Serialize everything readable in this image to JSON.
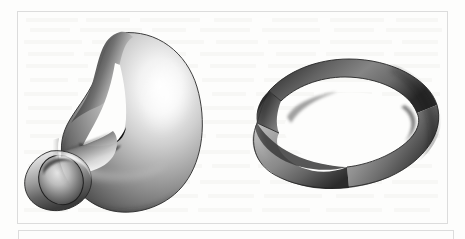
{
  "page": {
    "background_color": "#fdfdfc",
    "width": 465,
    "height": 239,
    "scan_artifact": "faint reverse-side text bleed-through"
  },
  "figure_box": {
    "name": "figure frame",
    "border_color": "#dcdcdc"
  },
  "caption_box": {
    "name": "caption frame below figure",
    "border_color": "#dcdcdc",
    "text": ""
  },
  "figures": [
    {
      "id": "klein-bottle",
      "label": "Klein bottle",
      "description": "Grayscale shaded 3D rendering of an immersed Klein bottle: a tube that loops over, narrows through a handle, passes through the body wall and flares into an open elliptical mouth at lower left.",
      "position": "left",
      "shading": "diffuse gray with specular highlight upper-right and on the flared neck",
      "colors": {
        "highlight": "#fdfdfd",
        "midtone": "#9b9b9b",
        "shadow": "#3a3a3a",
        "deep_shadow": "#151515",
        "outline": "#272727"
      }
    },
    {
      "id": "mobius-strip",
      "label": "Mobius strip",
      "description": "Grayscale shaded 3D rendering of a Mobius band: a flat ribbon bent into a ring with a single half twist visible at the left side, the inner elliptical opening showing white page through it.",
      "position": "right",
      "shading": "linear gray gradient across the band, darkest on the right limb and at the twist",
      "colors": {
        "highlight": "#c9c9c9",
        "midtone": "#8e8e8e",
        "shadow": "#474747",
        "deep_shadow": "#1c1c1c",
        "outline": "#2a2a2a"
      }
    }
  ],
  "bleed_text_rows": [
    {
      "top": 18,
      "segments": [
        [
          26,
          52
        ],
        [
          86,
          44
        ],
        [
          140,
          60
        ],
        [
          214,
          38
        ],
        [
          272,
          46
        ],
        [
          330,
          54
        ],
        [
          396,
          42
        ]
      ]
    },
    {
      "top": 28,
      "segments": [
        [
          30,
          40
        ],
        [
          80,
          62
        ],
        [
          152,
          34
        ],
        [
          200,
          50
        ],
        [
          262,
          58
        ],
        [
          334,
          40
        ],
        [
          386,
          56
        ]
      ]
    },
    {
      "top": 40,
      "segments": [
        [
          24,
          58
        ],
        [
          92,
          36
        ],
        [
          138,
          66
        ],
        [
          216,
          42
        ],
        [
          268,
          52
        ],
        [
          330,
          62
        ],
        [
          402,
          36
        ]
      ]
    },
    {
      "top": 52,
      "segments": [
        [
          28,
          46
        ],
        [
          84,
          54
        ],
        [
          148,
          38
        ],
        [
          200,
          64
        ],
        [
          276,
          40
        ],
        [
          326,
          58
        ],
        [
          394,
          44
        ]
      ]
    },
    {
      "top": 64,
      "segments": [
        [
          26,
          62
        ],
        [
          98,
          34
        ],
        [
          142,
          56
        ],
        [
          210,
          46
        ],
        [
          268,
          60
        ],
        [
          340,
          38
        ],
        [
          388,
          52
        ]
      ]
    },
    {
      "top": 78,
      "segments": [
        [
          30,
          38
        ],
        [
          78,
          58
        ],
        [
          146,
          44
        ],
        [
          202,
          52
        ],
        [
          264,
          36
        ],
        [
          312,
          64
        ],
        [
          386,
          46
        ]
      ]
    },
    {
      "top": 92,
      "segments": [
        [
          24,
          54
        ],
        [
          88,
          42
        ],
        [
          140,
          60
        ],
        [
          212,
          34
        ],
        [
          256,
          58
        ],
        [
          324,
          48
        ],
        [
          382,
          58
        ]
      ]
    },
    {
      "top": 106,
      "segments": [
        [
          28,
          44
        ],
        [
          82,
          60
        ],
        [
          152,
          36
        ],
        [
          198,
          56
        ],
        [
          264,
          50
        ],
        [
          326,
          40
        ],
        [
          376,
          62
        ]
      ]
    },
    {
      "top": 120,
      "segments": [
        [
          26,
          58
        ],
        [
          94,
          38
        ],
        [
          142,
          52
        ],
        [
          204,
          62
        ],
        [
          276,
          36
        ],
        [
          322,
          56
        ],
        [
          388,
          48
        ]
      ]
    },
    {
      "top": 134,
      "segments": [
        [
          30,
          50
        ],
        [
          90,
          46
        ],
        [
          148,
          58
        ],
        [
          216,
          40
        ],
        [
          266,
          54
        ],
        [
          330,
          44
        ],
        [
          384,
          56
        ]
      ]
    },
    {
      "top": 150,
      "segments": [
        [
          24,
          40
        ],
        [
          74,
          62
        ],
        [
          146,
          34
        ],
        [
          192,
          58
        ],
        [
          260,
          46
        ],
        [
          318,
          60
        ],
        [
          390,
          40
        ]
      ]
    },
    {
      "top": 164,
      "segments": [
        [
          28,
          56
        ],
        [
          92,
          40
        ],
        [
          140,
          62
        ],
        [
          212,
          38
        ],
        [
          258,
          52
        ],
        [
          320,
          58
        ],
        [
          388,
          44
        ]
      ]
    },
    {
      "top": 180,
      "segments": [
        [
          26,
          48
        ],
        [
          84,
          56
        ],
        [
          150,
          40
        ],
        [
          200,
          60
        ],
        [
          270,
          42
        ],
        [
          332,
          50
        ],
        [
          392,
          46
        ]
      ]
    },
    {
      "top": 194,
      "segments": [
        [
          30,
          60
        ],
        [
          98,
          36
        ],
        [
          144,
          54
        ],
        [
          208,
          46
        ],
        [
          264,
          58
        ],
        [
          336,
          38
        ],
        [
          384,
          54
        ]
      ]
    },
    {
      "top": 208,
      "segments": [
        [
          24,
          44
        ],
        [
          78,
          58
        ],
        [
          146,
          42
        ],
        [
          198,
          54
        ],
        [
          262,
          48
        ],
        [
          326,
          56
        ],
        [
          394,
          36
        ]
      ]
    }
  ]
}
